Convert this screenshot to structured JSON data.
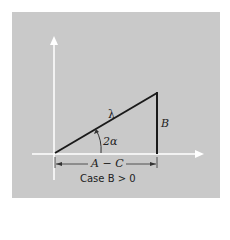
{
  "diagram": {
    "labels": {
      "hypotenuse": "λ",
      "angle": "2α",
      "opposite": "B",
      "adjacent": "A − C"
    },
    "caption": "Case B > 0",
    "colors": {
      "background": "#c9c9c9",
      "axes": "#ffffff",
      "triangle": "#1a1a1a"
    }
  }
}
